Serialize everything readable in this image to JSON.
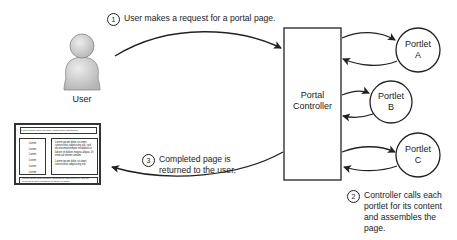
{
  "diagram": {
    "user": {
      "label": "User",
      "icon": "user-silhouette-icon"
    },
    "controller": {
      "line1": "Portal",
      "line2": "Controller"
    },
    "portlets": [
      {
        "line1": "Portlet",
        "line2": "A"
      },
      {
        "line1": "Portlet",
        "line2": "B"
      },
      {
        "line1": "Portlet",
        "line2": "C"
      }
    ],
    "steps": [
      {
        "number": "1",
        "text": "User makes a request for a portal page."
      },
      {
        "number": "2",
        "line1": "Controller calls each",
        "line2": "portlet for its content",
        "line3": "and assembles the",
        "line4": "page."
      },
      {
        "number": "3",
        "line1": "Completed page is",
        "line2": "returned to the user."
      }
    ],
    "page_mockup": {
      "header": "Lorem ipsum dolor sit amet, consectetur adipisicing",
      "left_items": [
        "Lorem",
        "Lorem",
        "Lorem",
        "Lorem",
        "Lorem",
        "Lorem"
      ],
      "right_text_1": "Lorem ipsum dolor sit amet, consectetur adipisicing elit, sed do eiusmod tempor incididunt ut labore et dolore magna aliqua. Ut enim ad minim veniam.",
      "right_text_2": "Lorem ipsum dolor sit amet, consectetur adipisicing elit.",
      "footer": "Lorem ipsum dolor sit amet, consectetur adipisicing elit, sed do eiusmod tempor incididunt ut labore et dolore."
    },
    "colors": {
      "stroke": "#222222",
      "user_fill": "#d0d0d0",
      "background": "#ffffff"
    }
  }
}
